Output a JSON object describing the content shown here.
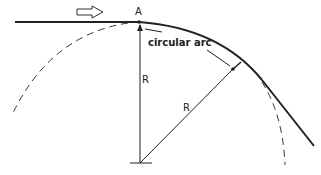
{
  "diagram": {
    "labels": {
      "point": "A",
      "arc": "circular arc",
      "radius_vertical": "R",
      "radius_diagonal": "R"
    },
    "colors": {
      "line": "#222222",
      "background": "#ffffff"
    }
  }
}
